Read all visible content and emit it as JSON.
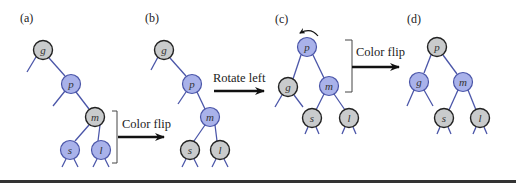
{
  "colors": {
    "black_node": "#c9cbcc",
    "red_node": "#a9b2ea",
    "node_stroke": "#222222",
    "edge": "#4a55a8",
    "bottom_rule": "#333333"
  },
  "panels": [
    {
      "label": "(a)",
      "nodes": [
        {
          "key": "g",
          "color": "black"
        },
        {
          "key": "p",
          "color": "red"
        },
        {
          "key": "m",
          "color": "black"
        },
        {
          "key": "s",
          "color": "red"
        },
        {
          "key": "l",
          "color": "red"
        }
      ]
    },
    {
      "label": "(b)",
      "nodes": [
        {
          "key": "g",
          "color": "black"
        },
        {
          "key": "p",
          "color": "red"
        },
        {
          "key": "m",
          "color": "red"
        },
        {
          "key": "s",
          "color": "black"
        },
        {
          "key": "l",
          "color": "black"
        }
      ]
    },
    {
      "label": "(c)",
      "nodes": [
        {
          "key": "p",
          "color": "red"
        },
        {
          "key": "g",
          "color": "black"
        },
        {
          "key": "m",
          "color": "red"
        },
        {
          "key": "s",
          "color": "black"
        },
        {
          "key": "l",
          "color": "black"
        }
      ]
    },
    {
      "label": "(d)",
      "nodes": [
        {
          "key": "p",
          "color": "black"
        },
        {
          "key": "g",
          "color": "red"
        },
        {
          "key": "m",
          "color": "red"
        },
        {
          "key": "s",
          "color": "black"
        },
        {
          "key": "l",
          "color": "black"
        }
      ]
    }
  ],
  "transitions": [
    {
      "label": "Color flip",
      "from": "(a)",
      "to": "(b)"
    },
    {
      "label": "Rotate left",
      "from": "(b)",
      "to": "(c)"
    },
    {
      "label": "Color flip",
      "from": "(c)",
      "to": "(d)"
    }
  ]
}
